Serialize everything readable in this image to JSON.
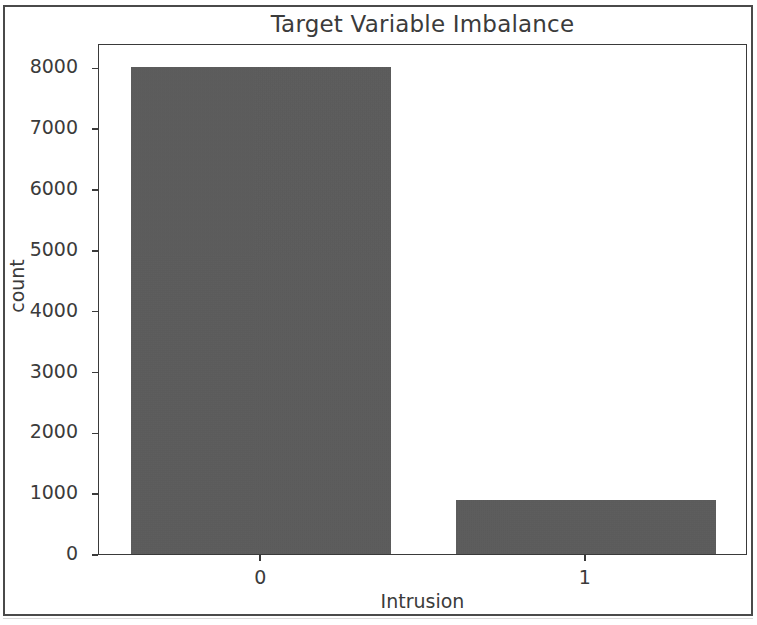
{
  "figure": {
    "width": 757,
    "height": 625,
    "background_color": "#ffffff",
    "frame_color": "#4a4a4a"
  },
  "chart_data": {
    "type": "bar",
    "title": "Target Variable Imbalance",
    "xlabel": "Intrusion",
    "ylabel": "count",
    "categories": [
      "0",
      "1"
    ],
    "values": [
      8000,
      880
    ],
    "series": [
      {
        "name": "count",
        "values": [
          8000,
          880
        ]
      }
    ],
    "yticks": [
      0,
      1000,
      2000,
      3000,
      4000,
      5000,
      6000,
      7000,
      8000
    ],
    "ytick_labels": [
      "0",
      "1000",
      "2000",
      "3000",
      "4000",
      "5000",
      "6000",
      "7000",
      "8000"
    ],
    "xtick_labels": [
      "0",
      "1"
    ],
    "ylim": [
      0,
      8400
    ],
    "grid": false,
    "legend": null,
    "bar_color": "#5a5a5a",
    "axis_color": "#3a3a3a",
    "text_color": "#3b3b3b"
  }
}
